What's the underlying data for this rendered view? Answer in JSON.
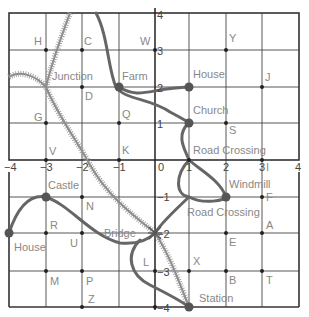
{
  "map": {
    "x_ticks": [
      "−4",
      "−3",
      "−2",
      "−1",
      "0",
      "1",
      "2",
      "3",
      "4"
    ],
    "y_ticks_top": [
      "4",
      "3",
      "2",
      "1"
    ],
    "y_ticks_bottom": [
      "−1",
      "−2",
      "−3",
      "−4"
    ],
    "landmarks": {
      "junction": "Junction",
      "farm": "Farm",
      "house_ne": "House",
      "church": "Church",
      "road_crossing_top": "Road Crossing",
      "castle": "Castle",
      "windmill": "Windmill",
      "road_crossing_bottom": "Road Crossing",
      "house_w": "House",
      "bridge": "Bridge",
      "station": "Station"
    },
    "points": {
      "H": "H",
      "C": "C",
      "W": "W",
      "Y": "Y",
      "J": "J",
      "D": "D",
      "G": "G",
      "Q": "Q",
      "S": "S",
      "V": "V",
      "K": "K",
      "I": "I",
      "N": "N",
      "F": "F",
      "R": "R",
      "U": "U",
      "A": "A",
      "E": "E",
      "L": "L",
      "X": "X",
      "M": "M",
      "P": "P",
      "B": "B",
      "T": "T",
      "Z": "Z"
    }
  }
}
